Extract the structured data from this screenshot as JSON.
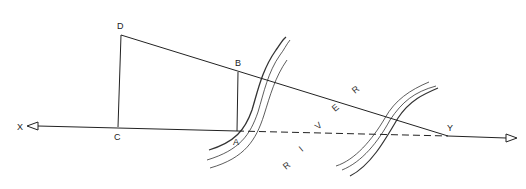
{
  "diagram": {
    "points": {
      "X": "X",
      "Y": "Y",
      "A": "A",
      "B": "B",
      "C": "C",
      "D": "D"
    },
    "river_letters": [
      "R",
      "I",
      "V",
      "E",
      "R"
    ],
    "colors": {
      "line": "#222222",
      "bank": "#444444",
      "background": "#ffffff"
    }
  }
}
